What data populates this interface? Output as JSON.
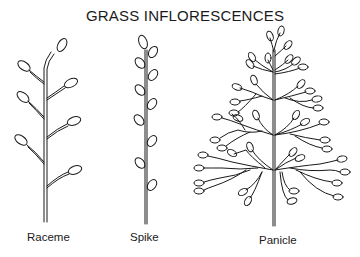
{
  "title": "GRASS INFLORESCENCES",
  "figures": [
    {
      "id": "raceme",
      "label": "Raceme"
    },
    {
      "id": "spike",
      "label": "Spike"
    },
    {
      "id": "panicle",
      "label": "Panicle"
    }
  ],
  "colors": {
    "ink": "#1a1a1a",
    "background": "#ffffff"
  }
}
